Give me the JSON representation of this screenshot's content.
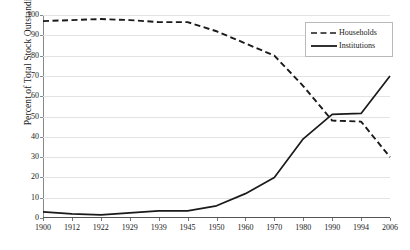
{
  "chart_data": {
    "type": "line",
    "title": "",
    "xlabel": "",
    "ylabel": "Percent of Total Stock Outstanding",
    "categories": [
      "1900",
      "1912",
      "1922",
      "1929",
      "1939",
      "1945",
      "1950",
      "1960",
      "1970",
      "1980",
      "1990",
      "1994",
      "2006"
    ],
    "ylim": [
      0,
      100
    ],
    "ytick_values": [
      0,
      10,
      20,
      30,
      40,
      50,
      60,
      70,
      80,
      90,
      100
    ],
    "ytick_labels": [
      "0",
      "10",
      "20",
      "30",
      "40",
      "50",
      "60",
      "70",
      "80",
      "90",
      "100"
    ],
    "grid": true,
    "legend_position": "top-right",
    "series": [
      {
        "name": "Households",
        "style": "dashed",
        "color": "#1a1a1a",
        "values": [
          97,
          97.5,
          98,
          97.5,
          96.5,
          96.5,
          92,
          86,
          80,
          65,
          48,
          47.5,
          30
        ]
      },
      {
        "name": "Institutions",
        "style": "solid",
        "color": "#1a1a1a",
        "values": [
          3,
          2,
          1.5,
          2.5,
          3.5,
          3.5,
          6,
          12,
          20,
          39,
          51,
          51.5,
          70
        ]
      }
    ]
  },
  "legend": {
    "items": [
      {
        "label": "Households",
        "style": "dashed"
      },
      {
        "label": "Institutions",
        "style": "solid"
      }
    ]
  }
}
